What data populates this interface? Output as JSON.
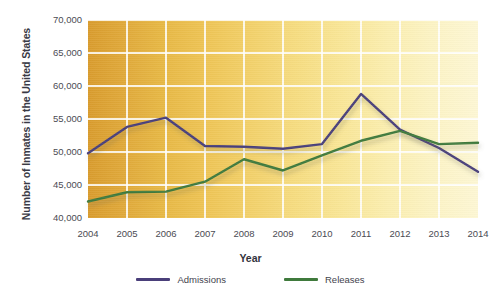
{
  "chart_data": {
    "type": "line",
    "title": "",
    "xlabel": "Year",
    "ylabel": "Number of Inmates in the United States",
    "categories": [
      "2004",
      "2005",
      "2006",
      "2007",
      "2008",
      "2009",
      "2010",
      "2011",
      "2012",
      "2013",
      "2014"
    ],
    "x": [
      2004,
      2005,
      2006,
      2007,
      2008,
      2009,
      2010,
      2011,
      2012,
      2013,
      2014
    ],
    "xlim": [
      2004,
      2014
    ],
    "ylim": [
      40000,
      70000
    ],
    "yticks": [
      40000,
      45000,
      50000,
      55000,
      60000,
      65000,
      70000
    ],
    "ytick_labels": [
      "40,000",
      "45,000",
      "50,000",
      "55,000",
      "60,000",
      "65,000",
      "70,000"
    ],
    "grid": true,
    "legend_position": "bottom",
    "series": [
      {
        "name": "Admissions",
        "color": "#4a3f7a",
        "values": [
          49800,
          53800,
          55200,
          50900,
          50800,
          50500,
          51200,
          58800,
          53400,
          50600,
          47000
        ]
      },
      {
        "name": "Releases",
        "color": "#3f7a3c",
        "values": [
          42500,
          43900,
          44000,
          45500,
          48900,
          47200,
          49500,
          51700,
          53200,
          51200,
          51400
        ]
      }
    ]
  },
  "axes": {
    "y_title": "Number of Inmates in the United States",
    "x_title": "Year"
  },
  "legend": {
    "items": [
      {
        "label": "Admissions",
        "color": "#4a3f7a"
      },
      {
        "label": "Releases",
        "color": "#3f7a3c"
      }
    ]
  },
  "caption": ""
}
